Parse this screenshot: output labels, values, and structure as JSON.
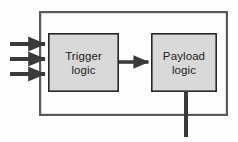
{
  "diagram": {
    "type": "block-diagram",
    "background_color": "#fefefe",
    "outer_container": {
      "name": "outer-boundary",
      "label": "",
      "x": 39,
      "y": 11,
      "width": 189,
      "height": 105,
      "stroke_color": "#595959",
      "stroke_width": 2.2,
      "fill": "none"
    },
    "blocks": [
      {
        "id": "trigger-logic",
        "line1": "Trigger",
        "line2": "logic",
        "x": 48,
        "y": 33,
        "width": 71,
        "height": 59,
        "fill_color": "#d9d9d9",
        "stroke_color": "#262626",
        "stroke_width": 1.6
      },
      {
        "id": "payload-logic",
        "line1": "Payload",
        "line2": "logic",
        "x": 151,
        "y": 33,
        "width": 66,
        "height": 59,
        "fill_color": "#d9d9d9",
        "stroke_color": "#262626",
        "stroke_width": 1.6
      }
    ],
    "connectors": [
      {
        "id": "input-arrow-1",
        "orientation": "horizontal",
        "x1": 10,
        "y1": 44,
        "x2": 48,
        "y2": 44,
        "color": "#3a3a3a",
        "stroke_width": 4,
        "arrowhead": "end"
      },
      {
        "id": "input-arrow-2",
        "orientation": "horizontal",
        "x1": 10,
        "y1": 59,
        "x2": 48,
        "y2": 59,
        "color": "#3a3a3a",
        "stroke_width": 4,
        "arrowhead": "end"
      },
      {
        "id": "input-arrow-3",
        "orientation": "horizontal",
        "x1": 10,
        "y1": 74,
        "x2": 48,
        "y2": 74,
        "color": "#3a3a3a",
        "stroke_width": 4,
        "arrowhead": "end"
      },
      {
        "id": "trigger-to-payload-arrow",
        "orientation": "horizontal",
        "x1": 119,
        "y1": 62,
        "x2": 151,
        "y2": 62,
        "color": "#3a3a3a",
        "stroke_width": 3.6,
        "arrowhead": "end"
      },
      {
        "id": "payload-output-line",
        "orientation": "vertical",
        "x1": 186,
        "y1": 92,
        "x2": 186,
        "y2": 137,
        "color": "#3a3a3a",
        "stroke_width": 4,
        "arrowhead": "none"
      }
    ]
  }
}
